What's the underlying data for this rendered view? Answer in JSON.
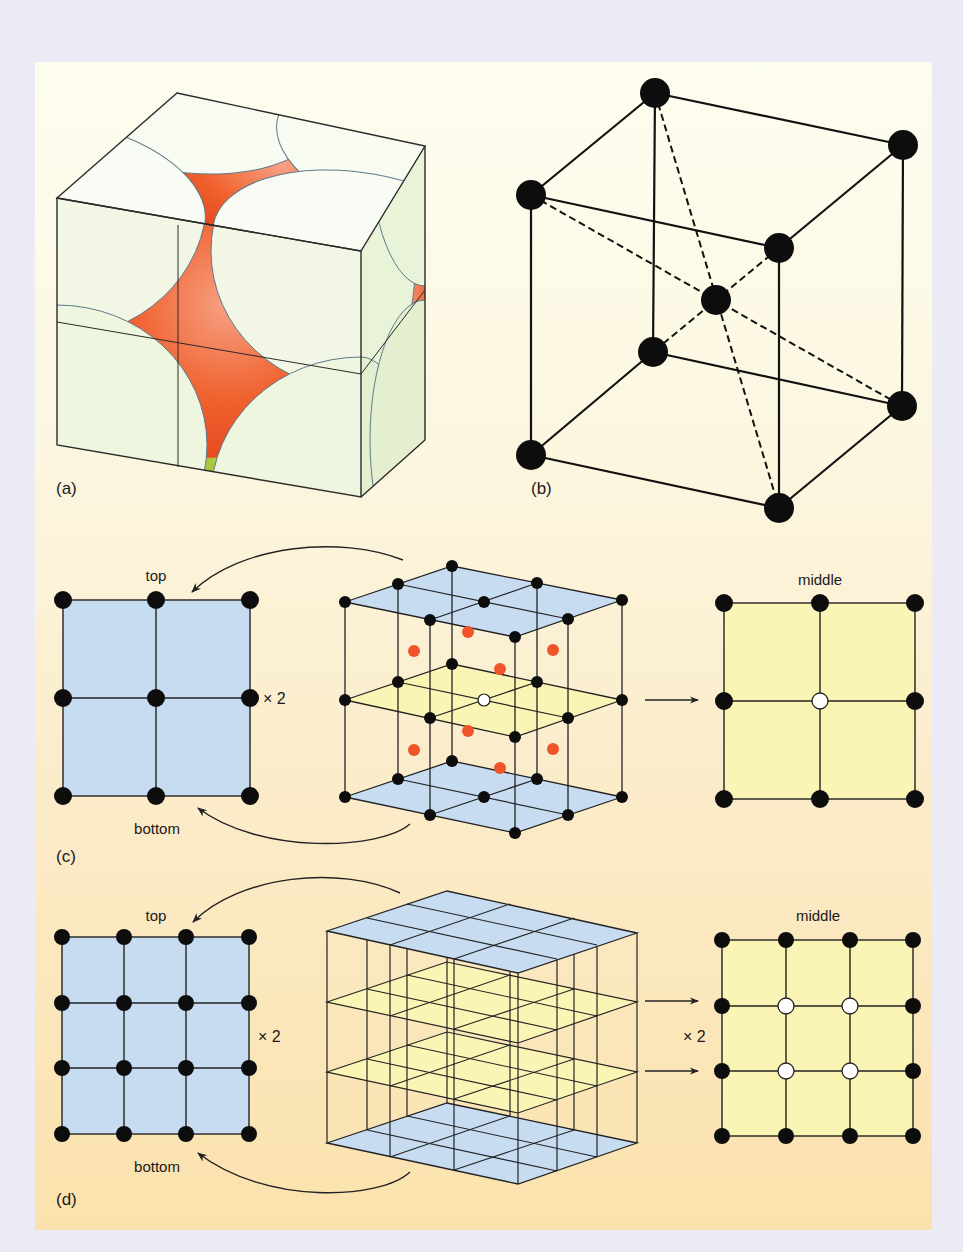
{
  "figure": {
    "panel_labels": {
      "a": "(a)",
      "b": "(b)",
      "c": "(c)",
      "d": "(d)"
    },
    "colors": {
      "frame": "#ecebf5",
      "panel_top": "#fdfdef",
      "panel_bottom": "#fbe2ad",
      "atom_black": "#111111",
      "atom_open": "#ffffff",
      "interstitial_red": "#f05a2a",
      "layer_blue": "#c9def2",
      "layer_yellow": "#fbf6b8",
      "sphere_white": "#f4f9ea",
      "sphere_green": "#a9c83c",
      "center_sphere": "#f0562a"
    },
    "panel_c": {
      "top_label": "top",
      "bottom_label": "bottom",
      "middle_label": "middle",
      "multiplier": "× 2",
      "left_grid": {
        "rows": 3,
        "cols": 3,
        "fill": "blue"
      },
      "right_grid": {
        "rows": 3,
        "cols": 3,
        "fill": "yellow",
        "open_atoms": [
          [
            1,
            1
          ]
        ]
      }
    },
    "panel_d": {
      "top_label": "top",
      "bottom_label": "bottom",
      "middle_label": "middle",
      "multiplier_left": "× 2",
      "multiplier_right": "× 2",
      "left_grid": {
        "rows": 4,
        "cols": 4,
        "fill": "blue"
      },
      "right_grid": {
        "rows": 4,
        "cols": 4,
        "fill": "yellow",
        "open_atoms": [
          [
            1,
            1
          ],
          [
            1,
            2
          ],
          [
            2,
            1
          ],
          [
            2,
            2
          ]
        ]
      }
    }
  }
}
